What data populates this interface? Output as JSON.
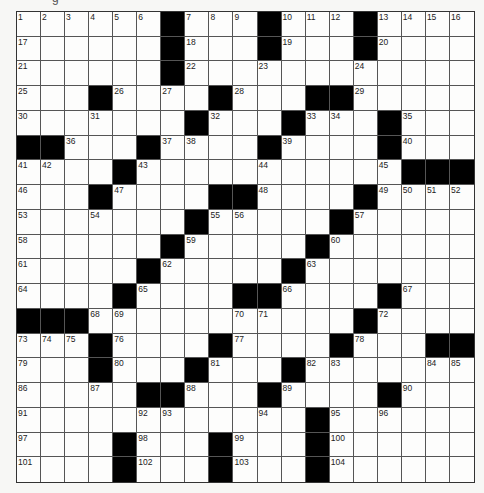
{
  "puzzle": {
    "top_fragment": "g",
    "rows": 19,
    "cols": 19,
    "layout": [
      "......#...#...#....",
      "......#...#...#....",
      "......#............",
      "...#....#...##.....",
      ".......#...#...#...",
      "##...#....#....#...",
      "....#...........###",
      "...#....##....#....",
      ".......#.....#.....",
      "......#.....#......",
      ".....#.....#.......",
      "....#....##....#...",
      "###...........#....",
      "...#....#....#...##",
      "...#...#...#.......",
      ".....##...#....#...",
      "............#......",
      "....#...#...#......",
      "....#...#...#......"
    ],
    "colors": {
      "black_square": "#000000",
      "white_square": "#fdfdfc",
      "grid_line": "#555555"
    }
  }
}
